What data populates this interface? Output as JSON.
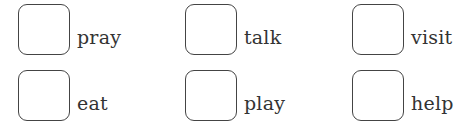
{
  "worksheet": {
    "items": [
      {
        "label": "pray"
      },
      {
        "label": "talk"
      },
      {
        "label": "visit"
      },
      {
        "label": "eat"
      },
      {
        "label": "play"
      },
      {
        "label": "help"
      }
    ]
  }
}
